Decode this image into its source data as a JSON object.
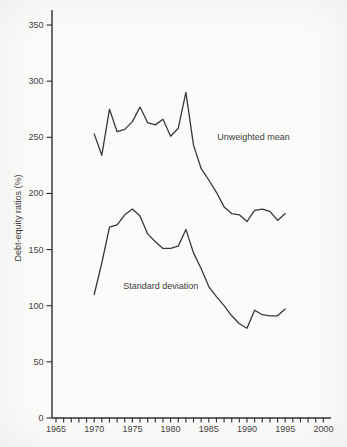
{
  "chart_data": {
    "type": "line",
    "x": [
      1970,
      1971,
      1972,
      1973,
      1974,
      1975,
      1976,
      1977,
      1978,
      1979,
      1980,
      1981,
      1982,
      1983,
      1984,
      1985,
      1986,
      1987,
      1988,
      1989,
      1990,
      1991,
      1992,
      1993,
      1994,
      1995
    ],
    "series": [
      {
        "name": "Unweighted mean",
        "values": [
          253,
          234,
          275,
          255,
          257,
          264,
          277,
          263,
          261,
          266,
          251,
          258,
          290,
          243,
          222,
          212,
          201,
          188,
          182,
          181,
          175,
          185,
          186,
          184,
          176,
          182
        ]
      },
      {
        "name": "Standard deviation",
        "values": [
          110,
          138,
          170,
          172,
          181,
          186,
          180,
          164,
          157,
          151,
          151,
          153,
          168,
          147,
          133,
          117,
          108,
          100,
          91,
          84,
          80,
          96,
          92,
          91,
          91,
          97
        ]
      }
    ],
    "title": "",
    "xlabel": "",
    "ylabel": "Debt-equity ratios (%)",
    "xlim": [
      1965,
      2000
    ],
    "ylim": [
      0,
      350
    ],
    "yticks": [
      0,
      50,
      100,
      150,
      200,
      250,
      300,
      350
    ],
    "xticks": [
      1965,
      1970,
      1975,
      1980,
      1985,
      1990,
      1995,
      2000
    ],
    "xtick_minor_step": 1,
    "grid": false,
    "legend_position": "none",
    "annotations": [
      {
        "text": "Unweighted mean",
        "x": 1986.1,
        "y": 248
      },
      {
        "text": "Standard deviation",
        "x": 1973.8,
        "y": 115
      }
    ],
    "line_color": "#383838",
    "axis_color": "#2f2f2f",
    "background": "#fbfbf9"
  }
}
